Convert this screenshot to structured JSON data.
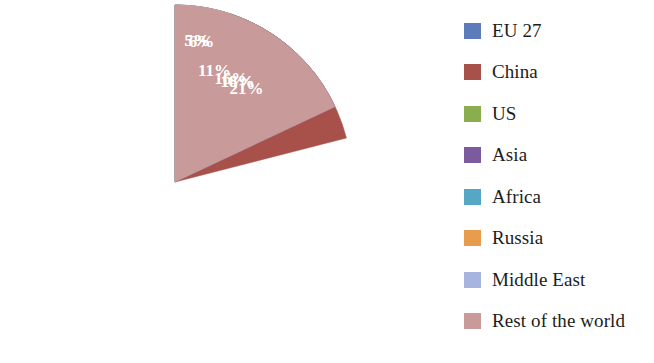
{
  "chart_data": {
    "type": "pie",
    "title": "",
    "subtitle": "",
    "xlabel": "",
    "ylabel": "",
    "legend_position": "right",
    "grid": false,
    "start_angle_deg": 0,
    "direction": "clockwise",
    "units": "percent",
    "categories": [
      "EU 27",
      "China",
      "US",
      "Asia",
      "Africa",
      "Russia",
      "Middle East",
      "Rest of the world"
    ],
    "values": [
      11,
      21,
      16,
      18,
      6,
      5,
      5,
      18
    ],
    "value_labels": [
      "11%",
      "21%",
      "16%",
      "18%",
      "6%",
      "5%",
      "5%",
      "18%"
    ],
    "colors": [
      "#5b7cb8",
      "#a8514a",
      "#8aad4e",
      "#7b5a9e",
      "#56a7c4",
      "#e89c4d",
      "#a8b4e0",
      "#c89a9a"
    ],
    "slices": [
      {
        "name": "EU 27",
        "value": 11,
        "label": "11%",
        "color": "#5b7cb8"
      },
      {
        "name": "China",
        "value": 21,
        "label": "21%",
        "color": "#a8514a"
      },
      {
        "name": "US",
        "value": 16,
        "label": "16%",
        "color": "#8aad4e"
      },
      {
        "name": "Asia",
        "value": 18,
        "label": "18%",
        "color": "#7b5a9e"
      },
      {
        "name": "Africa",
        "value": 6,
        "label": "6%",
        "color": "#56a7c4"
      },
      {
        "name": "Russia",
        "value": 5,
        "label": "5%",
        "color": "#e89c4d"
      },
      {
        "name": "Middle East",
        "value": 5,
        "label": "5%",
        "color": "#a8b4e0"
      },
      {
        "name": "Rest of the world",
        "value": 18,
        "label": "18%",
        "color": "#c89a9a"
      }
    ]
  },
  "legend": {
    "items": [
      {
        "label": "EU 27",
        "color": "#5b7cb8"
      },
      {
        "label": "China",
        "color": "#a8514a"
      },
      {
        "label": "US",
        "color": "#8aad4e"
      },
      {
        "label": "Asia",
        "color": "#7b5a9e"
      },
      {
        "label": "Africa",
        "color": "#56a7c4"
      },
      {
        "label": "Russia",
        "color": "#e89c4d"
      },
      {
        "label": "Middle East",
        "color": "#a8b4e0"
      },
      {
        "label": "Rest of the world",
        "color": "#c89a9a"
      }
    ]
  },
  "label_color": "#ffffff",
  "background_color": "#ffffff"
}
